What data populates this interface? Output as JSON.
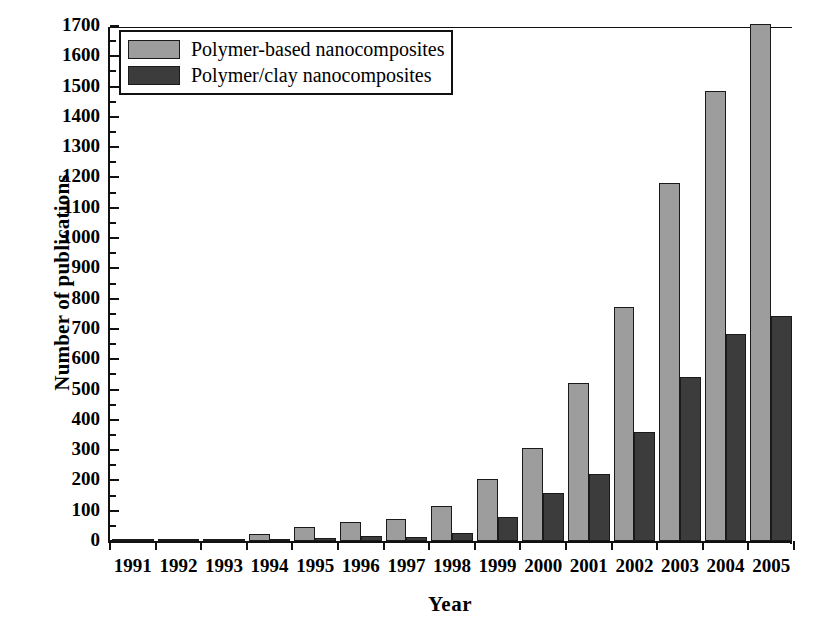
{
  "chart_data": {
    "type": "bar",
    "title": "",
    "xlabel": "Year",
    "ylabel": "Number of publications",
    "categories": [
      "1991",
      "1992",
      "1993",
      "1994",
      "1995",
      "1996",
      "1997",
      "1998",
      "1999",
      "2000",
      "2001",
      "2002",
      "2003",
      "2004",
      "2005"
    ],
    "series": [
      {
        "name": "Polymer-based nanocomposites",
        "color": "#9d9d9d",
        "values": [
          2,
          4,
          8,
          22,
          47,
          63,
          72,
          117,
          205,
          308,
          521,
          772,
          1182,
          1484,
          1706
        ]
      },
      {
        "name": "Polymer/clay nanocomposites",
        "color": "#3c3c3c",
        "values": [
          0,
          1,
          5,
          3,
          10,
          18,
          13,
          27,
          78,
          160,
          222,
          360,
          543,
          682,
          742
        ]
      }
    ],
    "ylim": [
      0,
      1700
    ],
    "ytick_step": 100,
    "yticks": [
      0,
      100,
      200,
      300,
      400,
      500,
      600,
      700,
      800,
      900,
      1000,
      1100,
      1200,
      1300,
      1400,
      1500,
      1600,
      1700
    ],
    "grid": false,
    "legend_position": "top-left",
    "legend": [
      "Polymer-based nanocomposites",
      "Polymer/clay nanocomposites"
    ]
  },
  "axes": {
    "ylabel": "Number of publications",
    "xlabel": "Year"
  },
  "legend": {
    "items": [
      {
        "label": "Polymer-based nanocomposites",
        "swatch": "light-gray-swatch"
      },
      {
        "label": "Polymer/clay nanocomposites",
        "swatch": "dark-gray-swatch"
      }
    ]
  },
  "colors": {
    "light_bar": "#9d9d9d",
    "dark_bar": "#3c3c3c",
    "axis": "#111111",
    "background": "#ffffff"
  }
}
